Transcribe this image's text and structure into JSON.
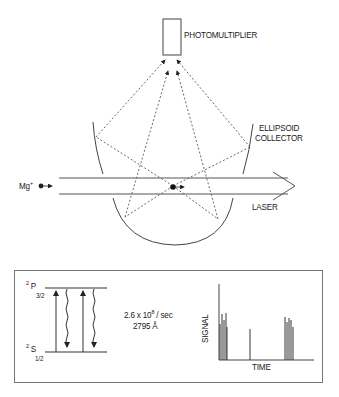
{
  "top_diagram": {
    "detector_label": "PHOTOMULTIPLIER",
    "collector_label_line1": "ELLIPSOID",
    "collector_label_line2": "COLLECTOR",
    "ion_label": "Mg",
    "ion_charge": "+",
    "beam_label": "LASER"
  },
  "energy_levels": {
    "upper_level": {
      "multiplicity": "2",
      "term": "P",
      "j": "3/2"
    },
    "lower_level": {
      "multiplicity": "2",
      "term": "S",
      "j": "1/2"
    },
    "rate_prefix": "2.6 x 10",
    "rate_exponent": "8",
    "rate_suffix": " / sec",
    "wavelength": "2795 Å"
  },
  "signal_plot": {
    "ylabel": "SIGNAL",
    "xlabel": "TIME",
    "colors": {
      "line": "#333333",
      "dash": "#444444",
      "border": "#777777"
    }
  },
  "chart_data": {
    "type": "bar",
    "title": "",
    "xlabel": "TIME",
    "ylabel": "SIGNAL",
    "pulses": [
      {
        "x": 220,
        "h": 36
      },
      {
        "x": 222,
        "h": 46
      },
      {
        "x": 224,
        "h": 40
      },
      {
        "x": 226,
        "h": 47
      },
      {
        "x": 227,
        "h": 33
      },
      {
        "x": 250,
        "h": 31
      },
      {
        "x": 285,
        "h": 43
      },
      {
        "x": 287,
        "h": 38
      },
      {
        "x": 289,
        "h": 42
      },
      {
        "x": 291,
        "h": 40
      },
      {
        "x": 293,
        "h": 33
      }
    ]
  }
}
